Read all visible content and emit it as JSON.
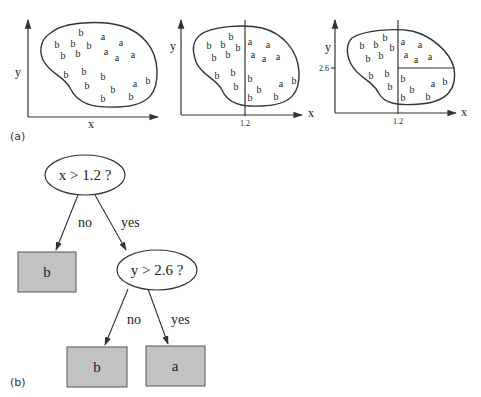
{
  "panel_a": {
    "label": "(a)",
    "plots": [
      {
        "x_label": "x",
        "y_label": "y",
        "points": [
          {
            "t": "b",
            "x": 81,
            "y": 33
          },
          {
            "t": "a",
            "x": 103,
            "y": 37
          },
          {
            "t": "b",
            "x": 57,
            "y": 45
          },
          {
            "t": "b",
            "x": 73,
            "y": 44
          },
          {
            "t": "b",
            "x": 89,
            "y": 46
          },
          {
            "t": "a",
            "x": 121,
            "y": 43
          },
          {
            "t": "b",
            "x": 63,
            "y": 56
          },
          {
            "t": "b",
            "x": 78,
            "y": 54
          },
          {
            "t": "a",
            "x": 106,
            "y": 52
          },
          {
            "t": "a",
            "x": 117,
            "y": 58
          },
          {
            "t": "a",
            "x": 133,
            "y": 55
          },
          {
            "t": "b",
            "x": 66,
            "y": 75
          },
          {
            "t": "b",
            "x": 84,
            "y": 72
          },
          {
            "t": "b",
            "x": 103,
            "y": 77
          },
          {
            "t": "b",
            "x": 87,
            "y": 86
          },
          {
            "t": "b",
            "x": 113,
            "y": 90
          },
          {
            "t": "a",
            "x": 135,
            "y": 84
          },
          {
            "t": "b",
            "x": 148,
            "y": 81
          },
          {
            "t": "b",
            "x": 103,
            "y": 99
          },
          {
            "t": "b",
            "x": 131,
            "y": 97
          }
        ]
      },
      {
        "x_label": "x",
        "y_label": "y",
        "x_split_label": "1.2",
        "points": [
          {
            "t": "b",
            "x": 231,
            "y": 37
          },
          {
            "t": "a",
            "x": 250,
            "y": 42
          },
          {
            "t": "a",
            "x": 268,
            "y": 45
          },
          {
            "t": "b",
            "x": 209,
            "y": 46
          },
          {
            "t": "b",
            "x": 223,
            "y": 45
          },
          {
            "t": "b",
            "x": 238,
            "y": 48
          },
          {
            "t": "b",
            "x": 214,
            "y": 58
          },
          {
            "t": "b",
            "x": 228,
            "y": 55
          },
          {
            "t": "a",
            "x": 253,
            "y": 55
          },
          {
            "t": "a",
            "x": 264,
            "y": 59
          },
          {
            "t": "a",
            "x": 278,
            "y": 57
          },
          {
            "t": "b",
            "x": 217,
            "y": 76
          },
          {
            "t": "b",
            "x": 233,
            "y": 73
          },
          {
            "t": "b",
            "x": 250,
            "y": 79
          },
          {
            "t": "b",
            "x": 236,
            "y": 87
          },
          {
            "t": "b",
            "x": 259,
            "y": 90
          },
          {
            "t": "a",
            "x": 281,
            "y": 84
          },
          {
            "t": "b",
            "x": 294,
            "y": 81
          },
          {
            "t": "b",
            "x": 250,
            "y": 98
          },
          {
            "t": "b",
            "x": 276,
            "y": 97
          }
        ]
      },
      {
        "x_label": "x",
        "y_label": "y",
        "x_split_label": "1.2",
        "y_split_label": "2.6",
        "points": [
          {
            "t": "b",
            "x": 385,
            "y": 38
          },
          {
            "t": "a",
            "x": 403,
            "y": 42
          },
          {
            "t": "a",
            "x": 420,
            "y": 45
          },
          {
            "t": "b",
            "x": 362,
            "y": 46
          },
          {
            "t": "b",
            "x": 376,
            "y": 45
          },
          {
            "t": "b",
            "x": 392,
            "y": 48
          },
          {
            "t": "b",
            "x": 368,
            "y": 59
          },
          {
            "t": "b",
            "x": 381,
            "y": 56
          },
          {
            "t": "a",
            "x": 406,
            "y": 55
          },
          {
            "t": "a",
            "x": 416,
            "y": 60
          },
          {
            "t": "a",
            "x": 430,
            "y": 57
          },
          {
            "t": "b",
            "x": 371,
            "y": 76
          },
          {
            "t": "b",
            "x": 387,
            "y": 74
          },
          {
            "t": "b",
            "x": 403,
            "y": 79
          },
          {
            "t": "b",
            "x": 390,
            "y": 87
          },
          {
            "t": "b",
            "x": 412,
            "y": 90
          },
          {
            "t": "a",
            "x": 433,
            "y": 84
          },
          {
            "t": "b",
            "x": 445,
            "y": 82
          },
          {
            "t": "b",
            "x": 403,
            "y": 98
          },
          {
            "t": "b",
            "x": 428,
            "y": 97
          }
        ]
      }
    ]
  },
  "panel_b": {
    "label": "(b)",
    "tree": {
      "root": {
        "question": "x > 1.2 ?"
      },
      "root_no_edge": "no",
      "root_yes_edge": "yes",
      "left_leaf": "b",
      "child": {
        "question": "y > 2.6 ?"
      },
      "child_no_edge": "no",
      "child_yes_edge": "yes",
      "child_left_leaf": "b",
      "child_right_leaf": "a"
    }
  },
  "colors": {
    "leaf_fill": "#c2c2c2",
    "stroke": "#333333",
    "background": "#ffffff"
  }
}
